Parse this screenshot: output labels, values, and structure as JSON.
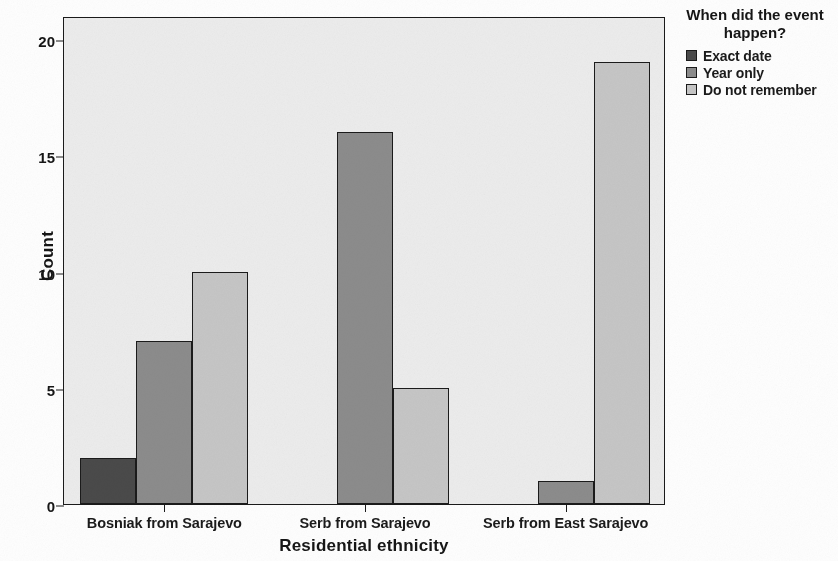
{
  "chart_data": {
    "type": "bar",
    "title": "",
    "xlabel": "Residential ethnicity",
    "ylabel": "Count",
    "categories": [
      "Bosniak from Sarajevo",
      "Serb from Sarajevo",
      "Serb from East Sarajevo"
    ],
    "series": [
      {
        "name": "Exact date",
        "color": "#4a4a4a",
        "values": [
          2,
          0,
          0
        ]
      },
      {
        "name": "Year only",
        "color": "#8c8c8c",
        "values": [
          7,
          16,
          1
        ]
      },
      {
        "name": "Do not remember",
        "color": "#c6c6c6",
        "values": [
          10,
          5,
          19
        ]
      }
    ],
    "ylim": [
      0,
      21
    ],
    "yticks": [
      0,
      5,
      10,
      15,
      20
    ],
    "ytick_labels": [
      "0",
      "5",
      "10",
      "15",
      "20"
    ],
    "grid": false,
    "legend_position": "right",
    "legend_title": "When did the event happen?",
    "plot_background": "#ececec",
    "axis_color": "#1a1a1a"
  },
  "legend": {
    "title_line_1": "When did the event",
    "title_line_2": "happen?"
  }
}
